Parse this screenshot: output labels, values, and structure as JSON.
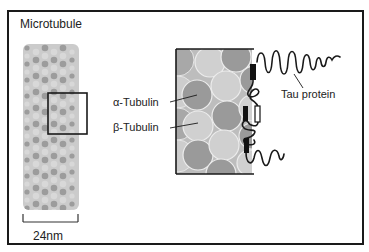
{
  "figure": {
    "title": "Microtubule",
    "scale_bar_label": "24nm",
    "labels": {
      "alpha_tubulin": "α-Tubulin",
      "beta_tubulin": "β-Tubulin",
      "tau_protein": "Tau protein"
    },
    "colors": {
      "alpha_tubulin": "#9a9a9a",
      "beta_tubulin": "#cfcfcf",
      "background_cylinder": "#bdbdbd",
      "outline": "#1a1a1a"
    }
  }
}
